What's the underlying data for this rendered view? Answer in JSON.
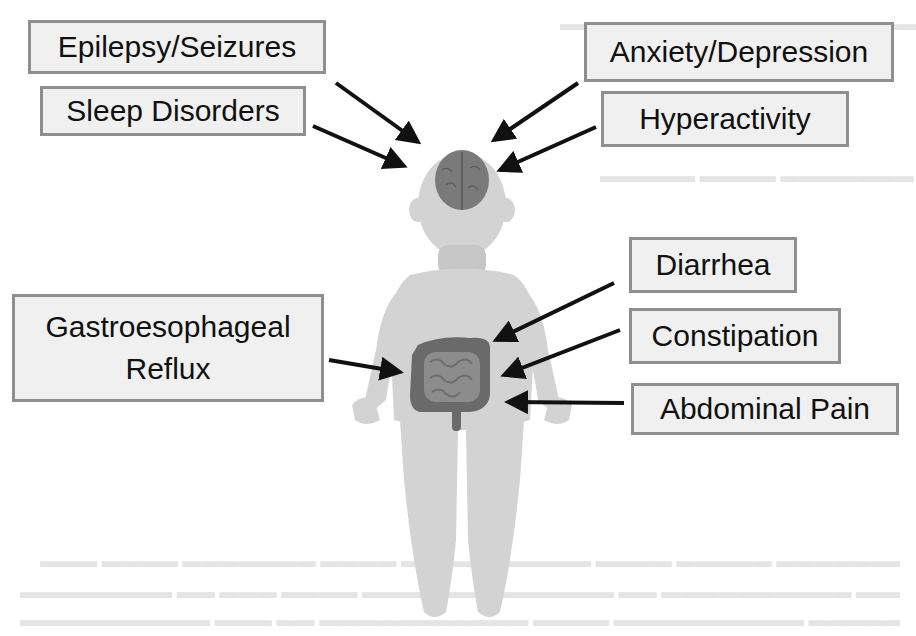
{
  "figure": {
    "labels": {
      "epilepsy": "Epilepsy/Seizures",
      "sleep": "Sleep Disorders",
      "anxiety": "Anxiety/Depression",
      "hyperactivity": "Hyperactivity",
      "gerd_line1": "Gastroesophageal",
      "gerd_line2": "Reflux",
      "diarrhea": "Diarrhea",
      "constipation": "Constipation",
      "abdominal_pain": "Abdominal Pain"
    },
    "colors": {
      "body": "#d3d3d3",
      "brain": "#7a7a7a",
      "colon": "#6a6a6a",
      "intestine": "#8c8c8c",
      "arrow": "#111111",
      "box_border": "#8f8f8f",
      "box_fill": "#f0f0f0"
    }
  }
}
